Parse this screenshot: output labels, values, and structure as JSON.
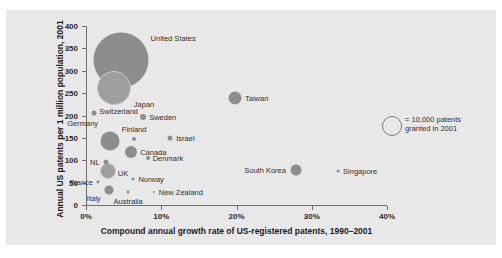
{
  "chart_data": {
    "type": "scatter",
    "title": "",
    "xlabel": "Compound annual growth rate of US-registered patents, 1990–2001",
    "ylabel": "Annual US patents per 1 million population, 2001",
    "xlim": [
      0,
      40
    ],
    "ylim": [
      0,
      400
    ],
    "x_ticks": [
      "0%",
      "10%",
      "20%",
      "30%",
      "40%"
    ],
    "x_tick_values": [
      0,
      10,
      20,
      30,
      40
    ],
    "y_ticks": [
      "0",
      "50",
      "100",
      "150",
      "200",
      "250",
      "300",
      "350",
      "400"
    ],
    "y_tick_values": [
      0,
      50,
      100,
      150,
      200,
      250,
      300,
      350,
      400
    ],
    "grid": false,
    "legend_position": "right",
    "bubble_meaning": "Bubble area is proportional to number of US patents granted in 2001",
    "points": [
      {
        "name": "United States",
        "x": 4.6,
        "y": 325,
        "size": 55,
        "label_pos": "right",
        "label_dx": 30,
        "label_dy": -22,
        "shade": "solid"
      },
      {
        "name": "Japan",
        "x": 3.7,
        "y": 262,
        "size": 32,
        "label_pos": "right",
        "label_dx": 20,
        "label_dy": 16,
        "shade": "light"
      },
      {
        "name": "Taiwan",
        "x": 19.8,
        "y": 240,
        "size": 13,
        "label_pos": "right",
        "label_dx": 10,
        "label_dy": 0,
        "shade": "solid"
      },
      {
        "name": "Switzerland",
        "x": 1.1,
        "y": 205,
        "size": 5,
        "label_pos": "right",
        "label_dx": 5,
        "label_dy": -2,
        "shade": "solid"
      },
      {
        "name": "Sweden",
        "x": 7.6,
        "y": 196,
        "size": 6,
        "label_pos": "right",
        "label_dx": 6,
        "label_dy": 0,
        "shade": "solid"
      },
      {
        "name": "Germany",
        "x": 3.2,
        "y": 143,
        "size": 19,
        "label_pos": "left",
        "label_dx": -12,
        "label_dy": -18,
        "shade": "solid"
      },
      {
        "name": "Finland",
        "x": 6.4,
        "y": 148,
        "size": 4,
        "label_pos": "center",
        "label_dx": 0,
        "label_dy": -10,
        "shade": "solid"
      },
      {
        "name": "Israel",
        "x": 11.2,
        "y": 150,
        "size": 5,
        "label_pos": "right",
        "label_dx": 6,
        "label_dy": 0,
        "shade": "solid"
      },
      {
        "name": "Canada",
        "x": 6.0,
        "y": 118,
        "size": 12,
        "label_pos": "right",
        "label_dx": 9,
        "label_dy": 0,
        "shade": "solid"
      },
      {
        "name": "Denmark",
        "x": 8.2,
        "y": 104,
        "size": 4,
        "label_pos": "right",
        "label_dx": 5,
        "label_dy": 0,
        "shade": "solid"
      },
      {
        "name": "NL",
        "x": 2.6,
        "y": 97,
        "size": 5,
        "label_pos": "left",
        "label_dx": -6,
        "label_dy": 0,
        "shade": "solid"
      },
      {
        "name": "UK",
        "x": 2.9,
        "y": 75,
        "size": 14,
        "label_pos": "right",
        "label_dx": 10,
        "label_dy": 2,
        "shade": "light"
      },
      {
        "name": "South Korea",
        "x": 27.9,
        "y": 78,
        "size": 11,
        "label_pos": "left",
        "label_dx": -10,
        "label_dy": 0,
        "shade": "solid"
      },
      {
        "name": "Singapore",
        "x": 33.5,
        "y": 76,
        "size": 3,
        "label_pos": "right",
        "label_dx": 5,
        "label_dy": 0,
        "shade": "solid"
      },
      {
        "name": "Norway",
        "x": 6.3,
        "y": 58,
        "size": 3,
        "label_pos": "right",
        "label_dx": 5,
        "label_dy": 0,
        "shade": "solid"
      },
      {
        "name": "France",
        "x": 1.6,
        "y": 52,
        "size": 3,
        "label_pos": "left",
        "label_dx": -5,
        "label_dy": 0,
        "shade": "solid"
      },
      {
        "name": "Italy",
        "x": 3.0,
        "y": 33,
        "size": 9,
        "label_pos": "left",
        "label_dx": -8,
        "label_dy": 8,
        "shade": "solid"
      },
      {
        "name": "Australia",
        "x": 5.6,
        "y": 28,
        "size": 3,
        "label_pos": "center",
        "label_dx": 0,
        "label_dy": 9,
        "shade": "solid"
      },
      {
        "name": "New Zealand",
        "x": 9.0,
        "y": 29,
        "size": 2,
        "label_pos": "right",
        "label_dx": 5,
        "label_dy": 0,
        "shade": "solid"
      }
    ]
  },
  "legend": {
    "marker_name": "legend-bubble",
    "text": "= 10,000 patents granted in 2001"
  },
  "colors": {
    "panel_background": "#e8e8e8",
    "bubble_fill": "#8d8d8d",
    "bubble_fill_light": "#9e9e9e",
    "axis": "#6e6e6e",
    "text": "#2a2a2a"
  }
}
